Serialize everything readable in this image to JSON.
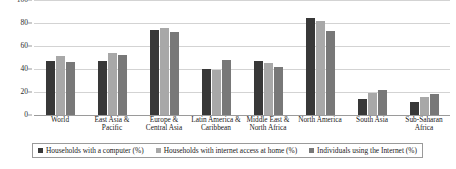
{
  "chart_data": {
    "type": "bar",
    "title": "",
    "xlabel": "",
    "ylabel": "",
    "ylim": [
      0,
      100
    ],
    "yticks": [
      0,
      20,
      40,
      60,
      80,
      100
    ],
    "grid": true,
    "legend_position": "bottom",
    "categories": [
      "World",
      "East Asia & Pacific",
      "Europe & Central Asia",
      "Latin America & Caribbean",
      "Middle East & North Africa",
      "North America",
      "South Asia",
      "Sub-Saharan Africa"
    ],
    "series": [
      {
        "name": "Households with a computer (%)",
        "color": "#383838",
        "values": [
          47,
          47,
          74,
          40,
          47,
          84,
          14,
          11
        ]
      },
      {
        "name": "Households with internet access at home (%)",
        "color": "#a8a8a8",
        "values": [
          51,
          54,
          76,
          39,
          45,
          82,
          19,
          16
        ]
      },
      {
        "name": "Individuals using the Internet (%)",
        "color": "#787878",
        "values": [
          46,
          52,
          72,
          48,
          42,
          73,
          22,
          18
        ]
      }
    ]
  }
}
